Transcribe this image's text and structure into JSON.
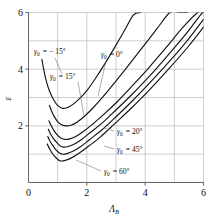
{
  "chart_data": {
    "type": "line",
    "title": "",
    "subtitle": "",
    "xlabel": "Λ",
    "xlabel_sub": "B",
    "ylabel": "ε",
    "ylabel_sub": "",
    "xlim": [
      0,
      6
    ],
    "ylim": [
      0,
      6
    ],
    "xticks": [
      0,
      2,
      4,
      6
    ],
    "xtick_labels": [
      "0",
      "2",
      "4",
      "6"
    ],
    "xminor": [
      1,
      3,
      5
    ],
    "yticks": [
      2,
      4,
      6
    ],
    "ytick_labels": [
      "2",
      "4",
      "6"
    ],
    "yminor": [
      1,
      3,
      5
    ],
    "grid": true,
    "grid_color": "#b9b9b9",
    "line_color": "#141414",
    "background": "#ffffff",
    "legend_position": "inline-annotations",
    "series": [
      {
        "name": "γ₀ = −15°",
        "label": "γ",
        "label_sub": "0",
        "label_value": "= − 15°",
        "min_x": 1.15,
        "min_y": 2.62,
        "x": [
          0.46,
          0.52,
          0.6,
          0.7,
          0.82,
          0.95,
          1.05,
          1.15,
          1.3,
          1.5,
          1.75,
          2.0,
          2.3,
          2.6,
          2.95,
          3.3,
          3.6,
          3.85
        ],
        "y": [
          4.35,
          4.0,
          3.62,
          3.28,
          3.0,
          2.78,
          2.68,
          2.62,
          2.63,
          2.74,
          2.96,
          3.24,
          3.68,
          4.16,
          4.76,
          5.38,
          5.92,
          6.0
        ]
      },
      {
        "name": "γ₀ = 0°",
        "label": "γ",
        "label_sub": "0",
        "label_value": "= 0°",
        "min_x": 1.3,
        "min_y": 2.0,
        "x": [
          0.72,
          0.8,
          0.9,
          1.02,
          1.15,
          1.3,
          1.45,
          1.65,
          1.9,
          2.2,
          2.55,
          2.95,
          3.4,
          3.9,
          4.4,
          4.85,
          5.2,
          5.45
        ],
        "y": [
          2.72,
          2.5,
          2.3,
          2.12,
          2.03,
          2.0,
          2.02,
          2.12,
          2.32,
          2.62,
          3.02,
          3.52,
          4.1,
          4.76,
          5.42,
          6.0,
          6.0,
          6.0
        ]
      },
      {
        "name": "γ₀ = 15°",
        "label": "γ",
        "label_sub": "0",
        "label_value": "= 15°",
        "min_x": 1.25,
        "min_y": 1.52,
        "x": [
          0.7,
          0.78,
          0.88,
          1.0,
          1.12,
          1.25,
          1.42,
          1.62,
          1.88,
          2.2,
          2.6,
          3.05,
          3.55,
          4.1,
          4.7,
          5.3,
          5.8,
          6.0
        ],
        "y": [
          2.18,
          2.0,
          1.82,
          1.66,
          1.56,
          1.52,
          1.54,
          1.62,
          1.8,
          2.06,
          2.42,
          2.86,
          3.4,
          4.02,
          4.74,
          5.48,
          6.0,
          6.0
        ]
      },
      {
        "name": "γ₀ = 20°",
        "label": "γ",
        "label_sub": "0",
        "label_value": "= 20°",
        "min_x": 1.2,
        "min_y": 1.25,
        "x": [
          0.68,
          0.76,
          0.86,
          0.98,
          1.08,
          1.2,
          1.36,
          1.56,
          1.82,
          2.14,
          2.55,
          3.0,
          3.52,
          4.1,
          4.72,
          5.35,
          5.9,
          6.0
        ],
        "y": [
          1.88,
          1.7,
          1.54,
          1.4,
          1.3,
          1.25,
          1.27,
          1.35,
          1.52,
          1.78,
          2.12,
          2.56,
          3.08,
          3.7,
          4.42,
          5.18,
          5.92,
          6.0
        ]
      },
      {
        "name": "γ₀ = 45°",
        "label": "γ",
        "label_sub": "0",
        "label_value": "= 45°",
        "min_x": 1.15,
        "min_y": 1.0,
        "x": [
          0.66,
          0.74,
          0.84,
          0.95,
          1.05,
          1.15,
          1.32,
          1.52,
          1.78,
          2.1,
          2.52,
          3.0,
          3.54,
          4.14,
          4.8,
          5.45,
          6.0
        ],
        "y": [
          1.62,
          1.45,
          1.3,
          1.14,
          1.05,
          1.0,
          1.02,
          1.1,
          1.26,
          1.52,
          1.86,
          2.32,
          2.86,
          3.5,
          4.24,
          5.02,
          5.76
        ]
      },
      {
        "name": "γ₀ = 60°",
        "label": "γ",
        "label_sub": "0",
        "label_value": "= 60°",
        "min_x": 1.1,
        "min_y": 0.76,
        "x": [
          0.64,
          0.72,
          0.8,
          0.9,
          1.0,
          1.1,
          1.26,
          1.46,
          1.72,
          2.06,
          2.48,
          2.96,
          3.52,
          4.14,
          4.8,
          5.48,
          6.0
        ],
        "y": [
          1.36,
          1.2,
          1.05,
          0.92,
          0.82,
          0.76,
          0.78,
          0.86,
          1.02,
          1.28,
          1.62,
          2.08,
          2.62,
          3.26,
          4.0,
          4.8,
          5.48
        ]
      }
    ],
    "annotations": [
      {
        "id": "ann-gamma-neg15",
        "text_sym": "γ",
        "text_sub": "0",
        "text_rest": "= − 15°",
        "x": 34,
        "y": 54,
        "leader": [
          [
            55,
            58
          ],
          [
            62,
            74
          ]
        ]
      },
      {
        "id": "ann-gamma-0",
        "text_sym": "γ",
        "text_sub": "0",
        "text_rest": "= 0°",
        "x": 101,
        "y": 57,
        "leader": [
          [
            106,
            61
          ],
          [
            98,
            96
          ]
        ]
      },
      {
        "id": "ann-gamma-15",
        "text_sym": "γ",
        "text_sub": "0",
        "text_rest": "= 15°",
        "x": 50,
        "y": 79,
        "leader": [
          [
            78,
            82
          ],
          [
            84,
            116
          ]
        ]
      },
      {
        "id": "ann-gamma-20",
        "text_sym": "γ",
        "text_sub": "0",
        "text_rest": "= 20°",
        "x": 117,
        "y": 134,
        "leader": [
          [
            114,
            131
          ],
          [
            104,
            128
          ]
        ]
      },
      {
        "id": "ann-gamma-45",
        "text_sym": "γ",
        "text_sub": "0",
        "text_rest": "= 45°",
        "x": 117,
        "y": 152,
        "leader": [
          [
            114,
            149
          ],
          [
            104,
            146
          ]
        ]
      },
      {
        "id": "ann-gamma-60",
        "text_sym": "γ",
        "text_sub": "0",
        "text_rest": "= 60°",
        "x": 104,
        "y": 174,
        "leader": [
          [
            101,
            171
          ],
          [
            76,
            160
          ]
        ]
      }
    ]
  }
}
